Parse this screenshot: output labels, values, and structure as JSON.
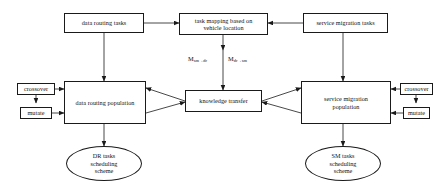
{
  "diagram": {
    "background_color": "#ffffff",
    "stroke_color": "#1a1a1a",
    "text_color": "#111111",
    "nodes": {
      "data_routing_tasks": {
        "label": "data routing tasks",
        "shape": "rectangle"
      },
      "task_mapping": {
        "line1": "task mapping based on",
        "line2": "vehicle location",
        "shape": "rectangle"
      },
      "service_migration_tasks": {
        "label": "service migration tasks",
        "shape": "rectangle"
      },
      "crossover_left": {
        "label": "crossover",
        "shape": "rectangle"
      },
      "mutate_left": {
        "label": "mutate",
        "shape": "rectangle"
      },
      "data_routing_population": {
        "label": "data routing population",
        "shape": "rectangle"
      },
      "knowledge_transfer": {
        "label": "knowledge transfer",
        "shape": "rectangle"
      },
      "service_migration_population": {
        "line1": "service migration",
        "line2": "population",
        "shape": "rectangle"
      },
      "crossover_right": {
        "label": "crossover",
        "shape": "rectangle"
      },
      "mutate_right": {
        "label": "mutate",
        "shape": "rectangle"
      },
      "dr_scheme": {
        "line1": "DR tasks",
        "line2": "scheduling",
        "line3": "scheme",
        "shape": "ellipse"
      },
      "sm_scheme": {
        "line1": "SM tasks",
        "line2": "scheduling",
        "line3": "scheme",
        "shape": "ellipse"
      }
    },
    "edge_labels": {
      "m_sm_to_dr_base": "M",
      "m_sm_to_dr_sub": "sm→dr",
      "m_dr_to_sm_base": "M",
      "m_dr_to_sm_sub": "dr→sm"
    }
  }
}
